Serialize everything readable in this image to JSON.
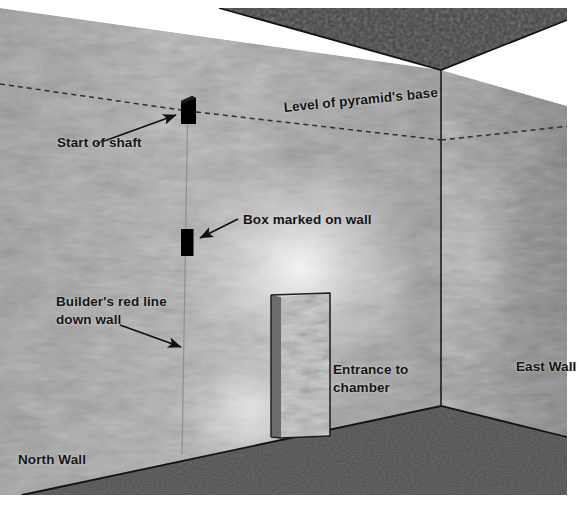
{
  "figure": {
    "type": "architectural-cutaway-illustration",
    "background_color": "#ffffff"
  },
  "scene": {
    "walls": {
      "north_wall": {
        "label": "North Wall",
        "fill_color": "#b9b9b9",
        "label_x": 18,
        "label_y": 452
      },
      "east_wall": {
        "label": "East Wall",
        "fill_color": "#b3b3b3",
        "label_x": 516,
        "label_y": 360
      }
    },
    "ceiling": {
      "name": "ceiling",
      "fill_color": "#4a4a4a"
    },
    "floor": {
      "name": "floor",
      "fill_color": "#555555"
    },
    "corner_line_color": "#222222"
  },
  "annotations": [
    {
      "id": "level-of-pyramids-base",
      "label": "Level of pyramid's base",
      "kind": "dashed-level-line",
      "line_color": "#2b2b2b",
      "x": 283,
      "y": 108,
      "rotation_deg": -5.6
    },
    {
      "id": "start-of-shaft",
      "label": "Start of shaft",
      "kind": "arrow-callout",
      "x": 57,
      "y": 142,
      "arrow_from": [
        96,
        144
      ],
      "arrow_to": [
        178,
        115
      ]
    },
    {
      "id": "box-marked-on-wall",
      "label": "Box marked on wall",
      "kind": "arrow-callout",
      "x": 243,
      "y": 213,
      "arrow_from": [
        238,
        219
      ],
      "arrow_to": [
        198,
        239
      ]
    },
    {
      "id": "builders-red-line-down-wall",
      "label": "Builder's red line\ndown wall",
      "label_line_1": "Builder's red line",
      "label_line_2": "down wall",
      "kind": "arrow-callout",
      "x": 56,
      "y": 296,
      "arrow_from": [
        120,
        325
      ],
      "arrow_to": [
        183,
        348
      ]
    },
    {
      "id": "entrance-to-chamber",
      "label": "Entrance to\nchamber",
      "label_line_1": "Entrance to",
      "label_line_2": "chamber",
      "kind": "text-callout",
      "x": 333,
      "y": 363
    }
  ],
  "features": {
    "shaft_opening": {
      "name": "shaft-opening-box",
      "color": "#000000",
      "x": 181,
      "y": 96,
      "width": 15,
      "height": 29
    },
    "marked_box": {
      "name": "marked-box",
      "color": "#000000",
      "x": 181,
      "y": 229,
      "width": 12,
      "height": 27
    },
    "red_line": {
      "name": "builders-red-line",
      "description": "faint vertical line down the north wall",
      "color": "#9b8c8c",
      "x": 187
    },
    "doorway": {
      "name": "chamber-doorway",
      "description": "recessed entrance opening in the north-east area"
    }
  }
}
